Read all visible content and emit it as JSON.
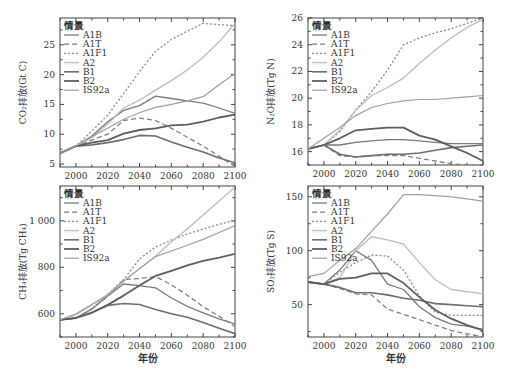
{
  "figure": {
    "xlabel": "年份",
    "legend_title": "情景",
    "styles": {
      "A1B": {
        "color": "#7a7a7a",
        "dash": "",
        "width": 1.3
      },
      "A1T": {
        "color": "#808080",
        "dash": "5,3",
        "width": 1.3
      },
      "A1F1": {
        "color": "#8a8a8a",
        "dash": "2,2",
        "width": 1.3
      },
      "A2": {
        "color": "#bdbdbd",
        "dash": "",
        "width": 1.3
      },
      "B1": {
        "color": "#6e6e6e",
        "dash": "",
        "width": 1.6
      },
      "B2": {
        "color": "#5e5e5e",
        "dash": "",
        "width": 1.8
      },
      "IS92a": {
        "color": "#a0a0a0",
        "dash": "",
        "width": 1.2
      }
    }
  },
  "chart_data": [
    {
      "id": "co2",
      "type": "line",
      "title": "",
      "ylabel": "CO₂排放(Gt C)",
      "xlabel": "",
      "x": [
        1990,
        2000,
        2010,
        2020,
        2030,
        2040,
        2050,
        2060,
        2070,
        2080,
        2090,
        2100
      ],
      "xlim": [
        1990,
        2100
      ],
      "ylim": [
        4.5,
        29.5
      ],
      "xticks": [
        2000,
        2020,
        2040,
        2060,
        2080,
        2100
      ],
      "yticks": [
        5,
        10,
        15,
        20,
        25
      ],
      "legend_position": "upper left",
      "series": [
        {
          "name": "A1B",
          "values": [
            6.8,
            8.0,
            9.7,
            12.1,
            14.0,
            14.8,
            16.4,
            16.0,
            15.6,
            15.2,
            14.4,
            13.5
          ]
        },
        {
          "name": "A1T",
          "values": [
            6.8,
            8.0,
            9.0,
            10.0,
            12.3,
            12.7,
            12.3,
            11.0,
            9.5,
            8.0,
            6.3,
            4.6
          ]
        },
        {
          "name": "A1F1",
          "values": [
            6.8,
            8.0,
            10.5,
            13.2,
            16.8,
            20.5,
            23.9,
            25.9,
            27.3,
            28.6,
            28.4,
            28.2
          ]
        },
        {
          "name": "A2",
          "values": [
            6.8,
            8.0,
            9.4,
            11.7,
            14.4,
            15.7,
            17.4,
            19.0,
            20.8,
            22.9,
            25.5,
            28.6
          ]
        },
        {
          "name": "B1",
          "values": [
            6.8,
            8.0,
            8.2,
            8.6,
            9.1,
            9.8,
            9.7,
            8.7,
            7.8,
            7.0,
            6.0,
            5.2
          ]
        },
        {
          "name": "B2",
          "values": [
            6.8,
            8.0,
            8.6,
            9.0,
            10.1,
            10.7,
            11.0,
            11.5,
            11.6,
            12.1,
            12.8,
            13.3
          ]
        },
        {
          "name": "IS92a",
          "values": [
            6.8,
            8.0,
            9.6,
            11.0,
            12.5,
            13.6,
            14.5,
            15.0,
            15.6,
            16.3,
            18.3,
            20.2
          ]
        }
      ]
    },
    {
      "id": "n2o",
      "type": "line",
      "title": "",
      "ylabel": "N₂O排放(Tg N)",
      "xlabel": "",
      "x": [
        1990,
        2000,
        2010,
        2020,
        2030,
        2040,
        2050,
        2060,
        2070,
        2080,
        2090,
        2100
      ],
      "xlim": [
        1990,
        2100
      ],
      "ylim": [
        15.0,
        26.0
      ],
      "xticks": [
        2000,
        2020,
        2040,
        2060,
        2080,
        2100
      ],
      "yticks": [
        16,
        18,
        20,
        22,
        24,
        26
      ],
      "legend_position": "upper left",
      "series": [
        {
          "name": "A1B",
          "values": [
            16.2,
            16.5,
            16.5,
            16.7,
            16.8,
            16.9,
            16.9,
            16.8,
            16.7,
            16.6,
            16.6,
            16.6
          ]
        },
        {
          "name": "A1T",
          "values": [
            16.2,
            16.5,
            15.7,
            15.6,
            15.7,
            15.7,
            15.7,
            15.5,
            15.3,
            15.1,
            15.0,
            15.0
          ]
        },
        {
          "name": "A1F1",
          "values": [
            16.2,
            16.5,
            17.5,
            19.1,
            20.5,
            22.1,
            24.0,
            24.5,
            24.9,
            25.2,
            25.6,
            26.0
          ]
        },
        {
          "name": "A2",
          "values": [
            16.2,
            16.5,
            17.6,
            19.1,
            20.2,
            20.8,
            21.5,
            22.6,
            23.6,
            24.5,
            25.3,
            25.9
          ]
        },
        {
          "name": "B1",
          "values": [
            16.2,
            16.5,
            15.8,
            15.6,
            15.7,
            15.8,
            15.8,
            15.9,
            16.1,
            16.3,
            16.4,
            16.5
          ]
        },
        {
          "name": "B2",
          "values": [
            16.2,
            16.5,
            17.0,
            17.6,
            17.7,
            17.8,
            17.8,
            17.2,
            16.9,
            16.4,
            15.9,
            15.3
          ]
        },
        {
          "name": "IS92a",
          "values": [
            16.2,
            17.0,
            17.8,
            18.7,
            19.3,
            19.6,
            19.8,
            19.9,
            19.9,
            20.0,
            20.1,
            20.2
          ]
        }
      ]
    },
    {
      "id": "ch4",
      "type": "line",
      "title": "",
      "ylabel": "CH₄排放(Tg CH₄)",
      "xlabel": "年份",
      "x": [
        1990,
        2000,
        2010,
        2020,
        2030,
        2040,
        2050,
        2060,
        2070,
        2080,
        2090,
        2100
      ],
      "xlim": [
        1990,
        2100
      ],
      "ylim": [
        500,
        1150
      ],
      "xticks": [
        2000,
        2020,
        2040,
        2060,
        2080,
        2100
      ],
      "yticks": [
        600,
        800,
        1000
      ],
      "ytick_labels": [
        "600",
        "800",
        "1 000"
      ],
      "legend_position": "upper left",
      "series": [
        {
          "name": "A1B",
          "values": [
            574,
            582,
            620,
            676,
            728,
            721,
            712,
            668,
            632,
            604,
            578,
            556
          ]
        },
        {
          "name": "A1T",
          "values": [
            574,
            582,
            620,
            676,
            747,
            752,
            760,
            725,
            680,
            630,
            590,
            545
          ]
        },
        {
          "name": "A1F1",
          "values": [
            574,
            582,
            622,
            684,
            747,
            836,
            887,
            917,
            943,
            965,
            985,
            1002
          ]
        },
        {
          "name": "A2",
          "values": [
            574,
            595,
            638,
            684,
            740,
            795,
            848,
            910,
            965,
            1025,
            1085,
            1145
          ]
        },
        {
          "name": "B1",
          "values": [
            574,
            582,
            605,
            636,
            644,
            640,
            618,
            600,
            585,
            562,
            538,
            514
          ]
        },
        {
          "name": "B2",
          "values": [
            574,
            582,
            604,
            638,
            678,
            722,
            763,
            785,
            808,
            828,
            842,
            858
          ]
        },
        {
          "name": "IS92a",
          "values": [
            574,
            600,
            640,
            680,
            740,
            793,
            846,
            870,
            895,
            920,
            950,
            980
          ]
        }
      ]
    },
    {
      "id": "so2",
      "type": "line",
      "title": "",
      "ylabel": "SO₂排放(Tg S)",
      "xlabel": "年份",
      "x": [
        1990,
        2000,
        2010,
        2020,
        2030,
        2040,
        2050,
        2060,
        2070,
        2080,
        2090,
        2100
      ],
      "xlim": [
        1990,
        2100
      ],
      "ylim": [
        20,
        160
      ],
      "xticks": [
        2000,
        2020,
        2040,
        2060,
        2080,
        2100
      ],
      "yticks": [
        50,
        100,
        150
      ],
      "legend_position": "upper left",
      "series": [
        {
          "name": "A1B",
          "values": [
            71,
            69,
            82,
            100,
            91,
            69,
            64,
            48,
            38,
            32,
            30,
            27
          ]
        },
        {
          "name": "A1T",
          "values": [
            71,
            69,
            65,
            60,
            59,
            46,
            41,
            36,
            31,
            26,
            23,
            20
          ]
        },
        {
          "name": "A1F1",
          "values": [
            71,
            69,
            80,
            89,
            96,
            95,
            82,
            58,
            43,
            40,
            40,
            40
          ]
        },
        {
          "name": "A2",
          "values": [
            71,
            69,
            75,
            100,
            113,
            110,
            106,
            89,
            73,
            64,
            62,
            60
          ]
        },
        {
          "name": "B1",
          "values": [
            71,
            69,
            66,
            61,
            61,
            59,
            56,
            54,
            51,
            50,
            49,
            48
          ]
        },
        {
          "name": "B2",
          "values": [
            71,
            69,
            74,
            75,
            79,
            79,
            70,
            57,
            45,
            37,
            31,
            26
          ]
        },
        {
          "name": "IS92a",
          "values": [
            76,
            79,
            91,
            102,
            118,
            134,
            152,
            152,
            151,
            150,
            148,
            146
          ]
        }
      ]
    }
  ]
}
